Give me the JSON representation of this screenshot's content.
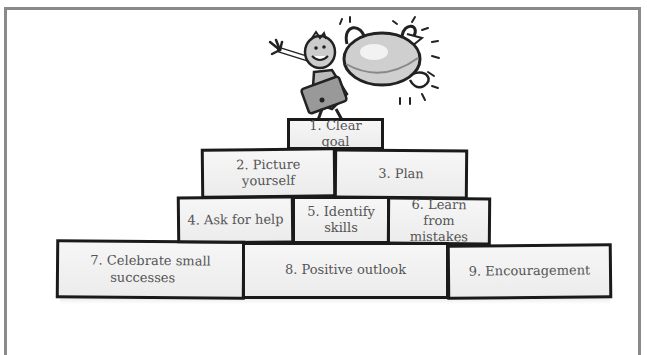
{
  "diagram": {
    "type": "pyramid",
    "illustration": "child-holding-trophy-icon",
    "rows": [
      {
        "blocks": [
          {
            "label": "1. Clear goal"
          }
        ]
      },
      {
        "blocks": [
          {
            "label": "2. Picture yourself"
          },
          {
            "label": "3. Plan"
          }
        ]
      },
      {
        "blocks": [
          {
            "label": "4. Ask for help"
          },
          {
            "label_line1": "5. Identify",
            "label_line2": "skills"
          },
          {
            "label_line1": "6. Learn from",
            "label_line2": "mistakes"
          }
        ]
      },
      {
        "blocks": [
          {
            "label_line1": "7. Celebrate small",
            "label_line2": "successes"
          },
          {
            "label": "8. Positive outlook"
          },
          {
            "label": "9. Encouragement"
          }
        ]
      }
    ],
    "colors": {
      "frame": "#8a8a8a",
      "block_border": "#1a1a1a",
      "block_fill": "#f0f0f0",
      "text": "#555555"
    }
  }
}
